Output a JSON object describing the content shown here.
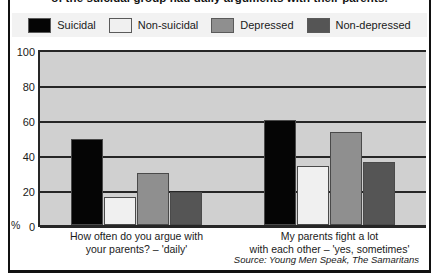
{
  "figure": {
    "title": "of the suicidal group had daily arguments with their parents.",
    "source": "Source: Young Men Speak, The Samaritans",
    "percent_symbol": "%"
  },
  "colors": {
    "suicidal": "#050505",
    "non_suicidal": "#f0f0f0",
    "depressed": "#8f8f8f",
    "non_depressed": "#555555",
    "plot_background": "#d0d0d0",
    "legend_background": "#f2f2f2",
    "axis": "#262626"
  },
  "chart_data": {
    "type": "bar",
    "title": "of the suicidal group had daily arguments with their parents.",
    "xlabel": "",
    "ylabel": "%",
    "ylim": [
      0,
      100
    ],
    "yticks": [
      0,
      20,
      40,
      60,
      80,
      100
    ],
    "grid": true,
    "legend_position": "top",
    "categories": [
      "How often do you argue with your parents? – 'daily'",
      "My parents fight a lot with each other – 'yes, sometimes'"
    ],
    "category_lines": [
      [
        "How often do you argue with",
        "your parents? – 'daily'"
      ],
      [
        "My parents fight a lot",
        "with each other – 'yes, sometimes'"
      ]
    ],
    "series": [
      {
        "name": "Suicidal",
        "color": "#050505",
        "values": [
          49,
          60
        ]
      },
      {
        "name": "Non-suicidal",
        "color": "#f0f0f0",
        "values": [
          16,
          34
        ]
      },
      {
        "name": "Depressed",
        "color": "#8f8f8f",
        "values": [
          30,
          53
        ]
      },
      {
        "name": "Non-depressed",
        "color": "#555555",
        "values": [
          19,
          36
        ]
      }
    ]
  }
}
